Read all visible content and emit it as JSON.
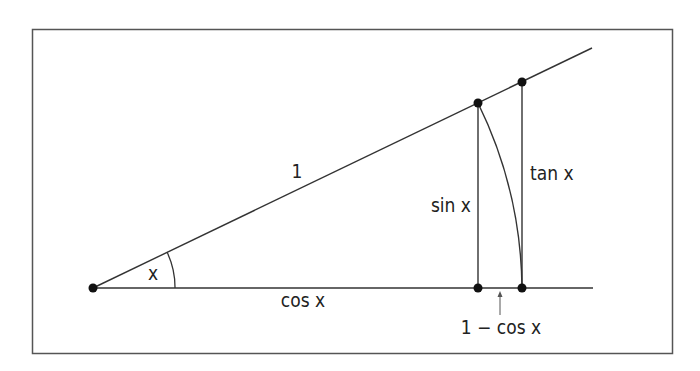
{
  "diagram": {
    "type": "trigonometric-inequality-figure",
    "labels": {
      "hypotenuse": "1",
      "angle": "x",
      "adjacent": "cos x",
      "opposite": "sin x",
      "tangent": "tan x",
      "difference": "1 − cos x"
    },
    "colors": {
      "stroke": "#333333",
      "frame": "#555555",
      "point": "#111111",
      "text": "#222222",
      "background": "#ffffff"
    },
    "points": {
      "origin": [
        93,
        288
      ],
      "sin_top": [
        478,
        103
      ],
      "tan_top": [
        522,
        82
      ],
      "sin_foot": [
        478,
        288
      ],
      "tan_foot": [
        522,
        288
      ]
    }
  }
}
